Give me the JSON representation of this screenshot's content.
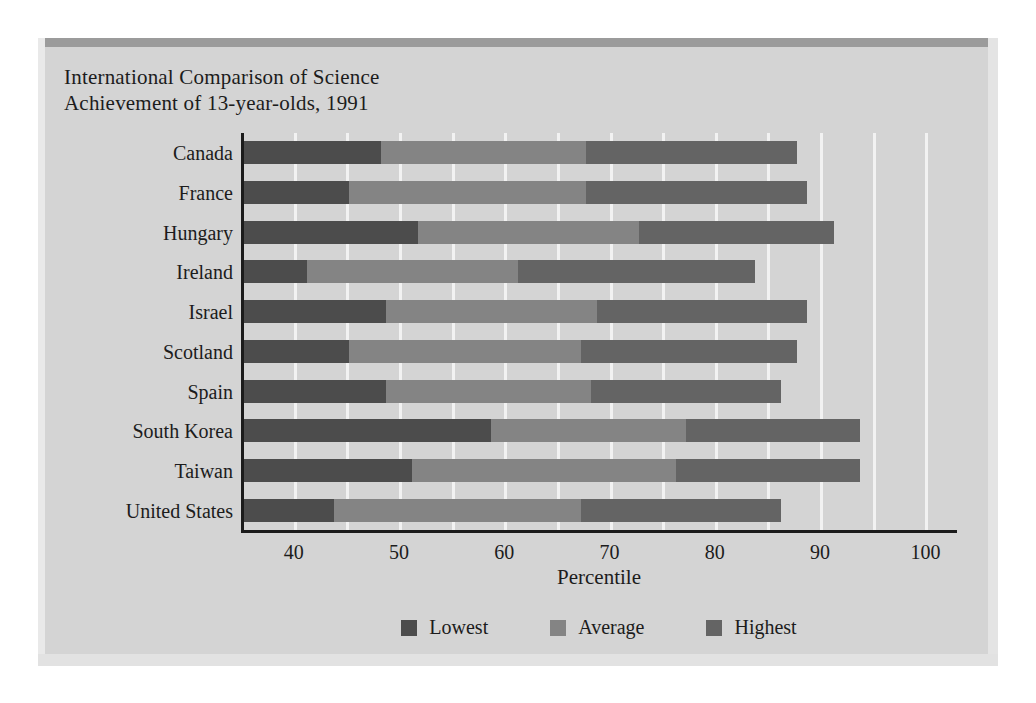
{
  "figure": {
    "title": "International Comparison of Science\nAchievement of 13-year-olds, 1991"
  },
  "chart_data": {
    "type": "bar",
    "orientation": "horizontal",
    "stacked": false,
    "title": "International Comparison of Science Achievement of 13-year-olds, 1991",
    "xlabel": "Percentile",
    "ylabel": "",
    "xlim": [
      35,
      103
    ],
    "xticks": [
      40,
      50,
      60,
      70,
      80,
      90,
      100
    ],
    "xtick_labels": [
      "40",
      "50",
      "60",
      "70",
      "80",
      "90",
      "100"
    ],
    "gridlines": [
      40,
      45,
      50,
      55,
      60,
      65,
      70,
      75,
      80,
      85,
      90,
      95,
      100
    ],
    "grid": true,
    "legend_position": "bottom",
    "categories": [
      "Canada",
      "France",
      "Hungary",
      "Ireland",
      "Israel",
      "Scotland",
      "Spain",
      "South Korea",
      "Taiwan",
      "United States"
    ],
    "series": [
      {
        "name": "Lowest",
        "color": "#4c4c4c",
        "values": [
          48,
          45,
          51.5,
          41,
          48.5,
          45,
          48.5,
          58.5,
          51,
          43.5
        ]
      },
      {
        "name": "Average",
        "color": "#848484",
        "values": [
          67.5,
          67.5,
          72.5,
          61,
          68.5,
          67,
          68,
          77,
          76,
          67
        ]
      },
      {
        "name": "Highest",
        "color": "#646464",
        "values": [
          87.5,
          88.5,
          91,
          83.5,
          88.5,
          87.5,
          86,
          93.5,
          93.5,
          86
        ]
      }
    ],
    "legend": [
      {
        "label": "Lowest",
        "color": "#4c4c4c"
      },
      {
        "label": "Average",
        "color": "#848484"
      },
      {
        "label": "Highest",
        "color": "#646464"
      }
    ]
  }
}
